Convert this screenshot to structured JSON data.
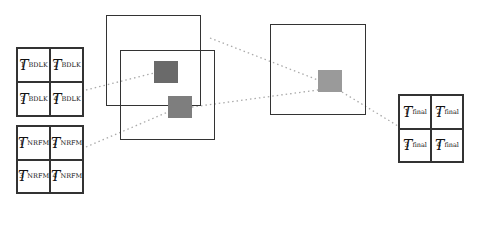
{
  "diagram": {
    "grids": [
      {
        "id": "bdlk",
        "label_base": "T",
        "subscript": "BDLK",
        "cells": [
          {
            "sup": "1"
          },
          {
            "sup": "2"
          },
          {
            "sup": "3"
          },
          {
            "sup": "4"
          }
        ]
      },
      {
        "id": "nrfm",
        "label_base": "T",
        "subscript": "NRFM",
        "cells": [
          {
            "sup": "1"
          },
          {
            "sup": "2"
          },
          {
            "sup": "3"
          },
          {
            "sup": "4"
          }
        ]
      },
      {
        "id": "final",
        "label_base": "T",
        "subscript": "final",
        "cells": [
          {
            "sup": "1"
          },
          {
            "sup": "2"
          },
          {
            "sup": "3"
          },
          {
            "sup": "4"
          }
        ]
      }
    ],
    "colors": {
      "patch_dark": "#6a6a6a",
      "patch_mid": "#7e7e7e",
      "patch_light": "#9a9a9a",
      "border": "#333333",
      "connector": "#b0b0b0"
    }
  }
}
